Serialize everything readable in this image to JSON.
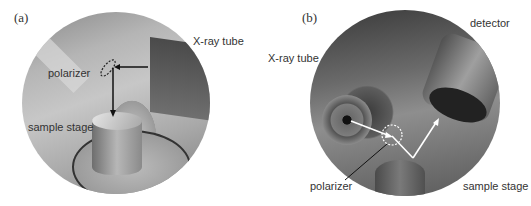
{
  "panel_a": {
    "label": "(a)",
    "annotations": {
      "xray_tube": "X-ray tube",
      "polarizer": "polarizer",
      "sample_stage": "sample stage"
    }
  },
  "panel_b": {
    "label": "(b)",
    "annotations": {
      "detector": "detector",
      "xray_tube": "X-ray tube",
      "polarizer": "polarizer",
      "sample_stage": "sample stage"
    }
  }
}
